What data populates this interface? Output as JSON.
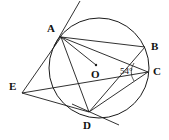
{
  "figure": {
    "kind": "circle-geometry-diagram",
    "background_color": "#ffffff",
    "stroke_color": "#1a1a1a",
    "label_color": "#111111",
    "circle": {
      "cx": 99,
      "cy": 68,
      "r": 50
    },
    "center_dot": {
      "cx": 96,
      "cy": 65,
      "r": 1.2
    }
  },
  "points": [
    {
      "id": "A",
      "label": "A",
      "x": 61,
      "y": 37,
      "label_x": 47,
      "label_y": 23,
      "on_circle": true
    },
    {
      "id": "B",
      "label": "B",
      "x": 145,
      "y": 47,
      "label_x": 151,
      "label_y": 41,
      "on_circle": true
    },
    {
      "id": "C",
      "label": "C",
      "x": 148,
      "y": 72,
      "label_x": 153,
      "label_y": 66,
      "on_circle": true
    },
    {
      "id": "D",
      "label": "D",
      "x": 89,
      "y": 112,
      "label_x": 83,
      "label_y": 120,
      "on_circle": true
    },
    {
      "id": "E",
      "label": "E",
      "x": 22,
      "y": 93,
      "label_x": 9,
      "label_y": 81,
      "on_circle": false
    },
    {
      "id": "O",
      "label": "O",
      "x": 96,
      "y": 65,
      "label_x": 91,
      "label_y": 69,
      "on_circle": false
    }
  ],
  "segments": [
    {
      "id": "A-B",
      "from": "A",
      "to": "B"
    },
    {
      "id": "A-C",
      "from": "A",
      "to": "C"
    },
    {
      "id": "A-O-C",
      "from": "A",
      "to": "O"
    },
    {
      "id": "A-D",
      "from": "A",
      "to": "D"
    },
    {
      "id": "A-E",
      "from": "A",
      "to": "E"
    },
    {
      "id": "E-D",
      "from": "E",
      "to": "D"
    },
    {
      "id": "E-C",
      "from": "E",
      "to": "C"
    },
    {
      "id": "D-C",
      "from": "D",
      "to": "C"
    },
    {
      "id": "D-B",
      "from": "D",
      "to": "B"
    }
  ],
  "tangents": [
    {
      "id": "tangent-at-A",
      "through": "A",
      "x1": 80,
      "y1": 1,
      "x2": 54,
      "y2": 46
    },
    {
      "id": "tangent-at-D",
      "through": "D",
      "x1": 72,
      "y1": 104,
      "x2": 119,
      "y2": 125
    }
  ],
  "angles": [
    {
      "id": "angle-at-C",
      "vertex": "C",
      "value": "54",
      "unit": "°",
      "text": "54°",
      "label_x": 120,
      "label_y": 67
    }
  ]
}
